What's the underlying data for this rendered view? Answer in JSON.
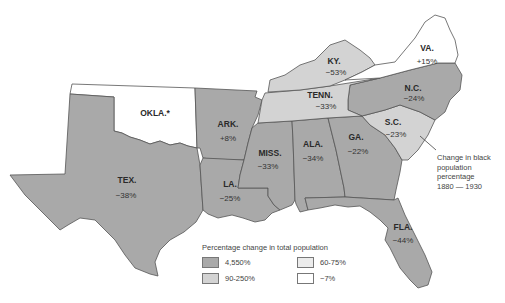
{
  "map": {
    "colors": {
      "high": "#a9a9a9",
      "mid": "#d3d3d3",
      "low": "#ececec",
      "neg": "#ffffff"
    },
    "states": [
      {
        "abbr": "OKLA.*",
        "value": ""
      },
      {
        "abbr": "ARK.",
        "value": "+8%"
      },
      {
        "abbr": "TEX.",
        "value": "−38%"
      },
      {
        "abbr": "LA.",
        "value": "−25%"
      },
      {
        "abbr": "MISS.",
        "value": "−33%"
      },
      {
        "abbr": "ALA.",
        "value": "−34%"
      },
      {
        "abbr": "GA.",
        "value": "−22%"
      },
      {
        "abbr": "FLA.",
        "value": "−44%"
      },
      {
        "abbr": "S.C.",
        "value": "−23%"
      },
      {
        "abbr": "N.C.",
        "value": "−24%"
      },
      {
        "abbr": "TENN.",
        "value": "−33%"
      },
      {
        "abbr": "KY.",
        "value": "−53%"
      },
      {
        "abbr": "VA.",
        "value": "+15%"
      }
    ],
    "annotation": {
      "line1": "Change in black",
      "line2": "population",
      "line3": "percentage",
      "line4": "1880 — 1930"
    }
  },
  "legend": {
    "title": "Percentage change in total population",
    "items": [
      {
        "label": "4,550%",
        "color": "#a9a9a9"
      },
      {
        "label": "60-75%",
        "color": "#ececec"
      },
      {
        "label": "90-250%",
        "color": "#d3d3d3"
      },
      {
        "label": "−7%",
        "color": "#ffffff"
      }
    ]
  }
}
